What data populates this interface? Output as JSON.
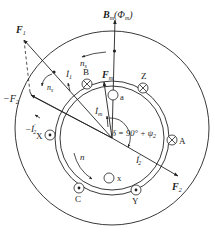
{
  "labels": {
    "Bm": "B",
    "Bm_sub": "m",
    "Bm_paren": "(Φ",
    "Bm_paren_sub": "m",
    "Bm_close": ")",
    "ns_top": "n",
    "ns_top_sub": "s",
    "ns_left": "n",
    "ns_left_sub": "s",
    "F1": "F",
    "F1_sub": "1",
    "minusF2": "−F",
    "minusF2_sub": "2",
    "I1": "İ",
    "I1_sub": "1",
    "Fm": "F",
    "Fm_sub": "m",
    "Im": "İ",
    "Im_sub": "m",
    "minusI2": "−İ",
    "minusI2_sub": "2",
    "minusI2_sup": "'",
    "delta": "δ = 90° + ψ",
    "delta_sub": "2",
    "I2": "İ",
    "I2_sub": "2",
    "I2_sup": "'",
    "F2": "F",
    "F2_sub": "2",
    "n_rotor": "n"
  },
  "conductors": {
    "stator": [
      {
        "name": "A",
        "symbol": "cross"
      },
      {
        "name": "B",
        "symbol": "cross"
      },
      {
        "name": "Z",
        "symbol": "cross"
      },
      {
        "name": "X",
        "symbol": "dot"
      },
      {
        "name": "C",
        "symbol": "dot"
      },
      {
        "name": "Y",
        "symbol": "dot"
      }
    ],
    "rotor": [
      {
        "name": "a",
        "symbol": "open"
      },
      {
        "name": "x",
        "symbol": "open"
      }
    ]
  }
}
